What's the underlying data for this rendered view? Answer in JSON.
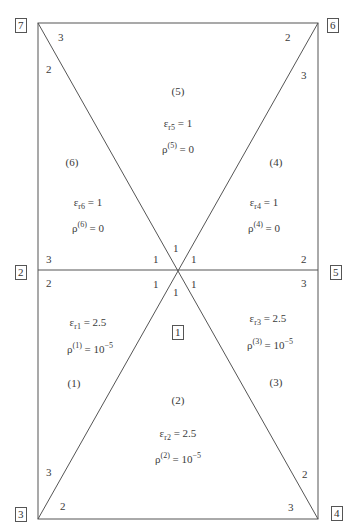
{
  "diagram": {
    "nodes": [
      {
        "id": "7",
        "label": "7"
      },
      {
        "id": "6",
        "label": "6"
      },
      {
        "id": "2",
        "label": "2"
      },
      {
        "id": "5",
        "label": "5"
      },
      {
        "id": "3",
        "label": "3"
      },
      {
        "id": "4",
        "label": "4"
      },
      {
        "id": "1",
        "label": "1"
      }
    ],
    "regions": [
      {
        "id": "1",
        "label": "(1)",
        "eps_sub": "r1",
        "eps_val": "= 2.5",
        "rho_sup": "(1)",
        "rho_val": "= 10",
        "rho_exp": "−5"
      },
      {
        "id": "2",
        "label": "(2)",
        "eps_sub": "r2",
        "eps_val": "= 2.5",
        "rho_sup": "(2)",
        "rho_val": "= 10",
        "rho_exp": "−5"
      },
      {
        "id": "3",
        "label": "(3)",
        "eps_sub": "r3",
        "eps_val": "= 2.5",
        "rho_sup": "(3)",
        "rho_val": "= 10",
        "rho_exp": "−5"
      },
      {
        "id": "4",
        "label": "(4)",
        "eps_sub": "r4",
        "eps_val": "= 1",
        "rho_sup": "(4)",
        "rho_val": "= 0",
        "rho_exp": ""
      },
      {
        "id": "5",
        "label": "(5)",
        "eps_sub": "r5",
        "eps_val": "= 1",
        "rho_sup": "(5)",
        "rho_val": "= 0",
        "rho_exp": ""
      },
      {
        "id": "6",
        "label": "(6)",
        "eps_sub": "r6",
        "eps_val": "= 1",
        "rho_sup": "(6)",
        "rho_val": "= 0",
        "rho_exp": ""
      }
    ],
    "eps_symbol": "ε",
    "rho_symbol": "ρ",
    "local_node_labels": {
      "one": "1",
      "two": "2",
      "three": "3"
    }
  }
}
